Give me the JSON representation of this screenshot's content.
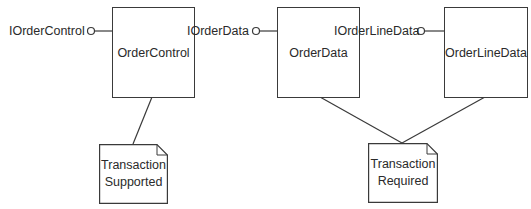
{
  "diagram": {
    "type": "component-diagram",
    "components": [
      {
        "id": "order-control",
        "label": "OrderControl"
      },
      {
        "id": "order-data",
        "label": "OrderData"
      },
      {
        "id": "order-line-data",
        "label": "OrderLineData"
      }
    ],
    "interfaces": [
      {
        "id": "i-order-control",
        "label": "IOrderControl",
        "provided_by": "order-control"
      },
      {
        "id": "i-order-data",
        "label": "IOrderData",
        "provided_by": "order-data"
      },
      {
        "id": "i-order-line-data",
        "label": "IOrderLineData",
        "provided_by": "order-line-data"
      }
    ],
    "notes": [
      {
        "id": "note-supported",
        "line1": "Transaction",
        "line2": "Supported",
        "attached_to": [
          "order-control"
        ]
      },
      {
        "id": "note-required",
        "line1": "Transaction",
        "line2": "Required",
        "attached_to": [
          "order-data",
          "order-line-data"
        ]
      }
    ],
    "colors": {
      "stroke": "#3a3a3a",
      "text": "#2a2a2a",
      "background": "#ffffff"
    }
  }
}
